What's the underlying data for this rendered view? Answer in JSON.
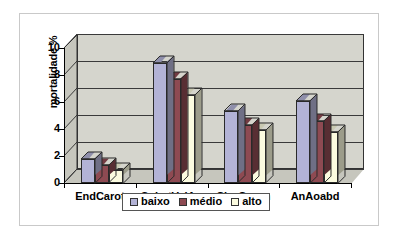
{
  "chart_data": {
    "type": "bar",
    "title": "",
    "subtitle": "",
    "xlabel": "",
    "ylabel": "mortalidade %",
    "ylim": [
      0,
      10
    ],
    "ytick_labels": [
      "10",
      "8",
      "6",
      "4",
      "2",
      "0"
    ],
    "ytick_values": [
      10,
      8,
      6,
      4,
      2,
      0
    ],
    "grid": true,
    "grid_axis": "y",
    "legend_position": "bottom",
    "style": "3d-clustered-column",
    "categories": [
      "EndCarot",
      "SubstValAo",
      "CirgCoron",
      "AnAoabd"
    ],
    "series": [
      {
        "name": "baixo",
        "color": "#b3b3d6",
        "values": [
          1.8,
          8.9,
          5.3,
          6.1
        ]
      },
      {
        "name": "médio",
        "color": "#8e4a52",
        "values": [
          1.3,
          7.7,
          4.3,
          4.6
        ]
      },
      {
        "name": "alto",
        "color": "#fbfbdf",
        "values": [
          1.0,
          6.5,
          3.9,
          3.8
        ]
      }
    ]
  },
  "legend": {
    "items": [
      {
        "label": "baixo"
      },
      {
        "label": "médio"
      },
      {
        "label": "alto"
      }
    ]
  },
  "axes": {
    "y_title": "mortalidade %",
    "y_ticks": [
      "10",
      "8",
      "6",
      "4",
      "2",
      "0"
    ],
    "x_categories": [
      "EndCarot",
      "SubstValAo",
      "CirgCoron",
      "AnAoabd"
    ]
  },
  "colors": {
    "plot_background": "#d5d5cd",
    "wall_3d": "#c6c6bd",
    "gridline": "#3a3a3a",
    "axis": "#000000",
    "frame_border": "#c9c9c9",
    "page_background": "#ffffff",
    "series_baixo": "#b3b3d6",
    "series_medio": "#8e4a52",
    "series_alto": "#fbfbdf"
  }
}
